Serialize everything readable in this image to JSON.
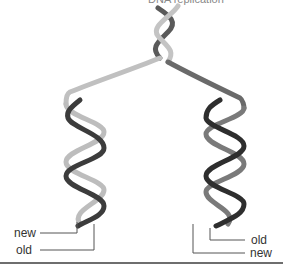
{
  "figure": {
    "top_caption_fragment": "DNA replication",
    "labels": {
      "left_new": "new",
      "left_old": "old",
      "right_old": "old",
      "right_new": "new"
    },
    "colors": {
      "old_strand": "#b8b8b8",
      "new_strand": "#3a3a3a",
      "leader": "#555555",
      "rule": "#6e6e6e"
    }
  }
}
